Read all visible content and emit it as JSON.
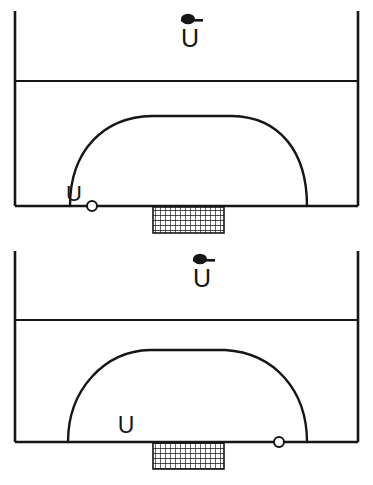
{
  "figure": {
    "background_color": "#ffffff",
    "line_color": "#161616",
    "panels": [
      {
        "id": "panel-top",
        "name": "upper-panel",
        "freestream_label": "U",
        "freestream_overbar": true,
        "local_velocity_label": "U",
        "local_label_position": "left",
        "marker_label": "o",
        "geometry": {
          "left_wall_x": 15,
          "right_wall_x": 358,
          "wall_top_y": 11,
          "divider_y": 81,
          "baseline_y": 206,
          "arc_left_foot_x": 70,
          "arc_right_foot_x": 307,
          "arc_apex_x": 190,
          "arc_apex_y": 116,
          "marker_x": 92,
          "marker_y": 206,
          "marker_r": 5,
          "block_x": 153,
          "block_y": 207,
          "block_w": 71,
          "block_h": 26
        }
      },
      {
        "id": "panel-bottom",
        "name": "lower-panel",
        "freestream_label": "U",
        "freestream_overbar": true,
        "local_velocity_label": "U",
        "local_label_position": "center",
        "marker_label": "o",
        "geometry": {
          "left_wall_x": 15,
          "right_wall_x": 358,
          "wall_top_y": 8,
          "divider_y": 77,
          "baseline_y": 199,
          "arc_left_foot_x": 68,
          "arc_right_foot_x": 307,
          "arc_apex_x": 188,
          "arc_apex_y": 107,
          "marker_x": 279,
          "marker_y": 199,
          "marker_r": 5,
          "block_x": 153,
          "block_y": 199,
          "block_w": 71,
          "block_h": 26
        }
      }
    ],
    "hatch": {
      "name": "cross-hatch-grid",
      "cell_size": 5,
      "stroke_width": 1.2
    }
  }
}
